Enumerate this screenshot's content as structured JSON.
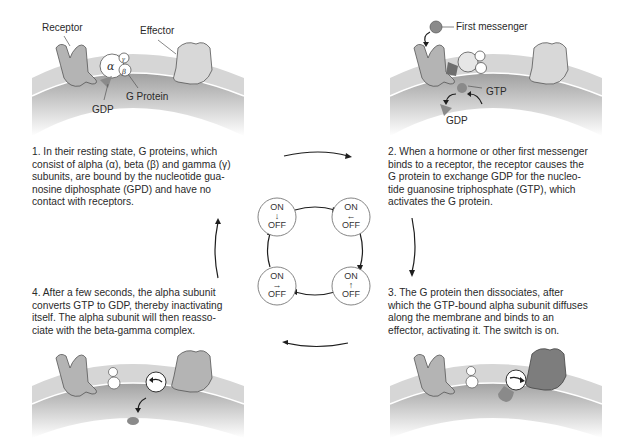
{
  "diagram": {
    "colors": {
      "membrane_outer": "#d6d6d6",
      "membrane_inner": "#8f8f8f",
      "protein_fill": "#b4b4b4",
      "protein_active": "#7d7d7d",
      "subunit_fill": "#ffffff",
      "gtp_fill": "#8a8a8a",
      "arrow": "#1e1e1e"
    },
    "panel1": {
      "labels": {
        "receptor": "Receptor",
        "effector": "Effector",
        "g_protein": "G Protein",
        "gdp": "GDP",
        "alpha": "α",
        "beta": "β",
        "gamma": "γ"
      },
      "caption": "1. In their resting state, G proteins, which\nconsist of alpha (α), beta (β) and gamma (γ)\nsubunits, are bound by the nucleotide gua-\nnosine diphosphate (GPD) and have no\ncontact with receptors."
    },
    "panel2": {
      "labels": {
        "first_messenger": "First messenger",
        "gtp": "GTP",
        "gdp": "GDP"
      },
      "caption": "2. When a hormone or other first messenger\nbinds to a receptor, the receptor causes the\nG protein to exchange GDP for the nucleo-\ntide guanosine triphosphate (GTP), which\nactivates the G protein."
    },
    "panel3": {
      "caption": "3. The G protein then dissociates, after\nwhich the GTP-bound alpha subunit diffuses\nalong the membrane and binds to an\neffector, activating it. The switch is on."
    },
    "panel4": {
      "caption": "4. After a few seconds, the alpha subunit\nconverts GTP to GDP, thereby inactivating\nitself. The alpha subunit will then reasso-\nciate with the beta-gamma complex."
    },
    "switch_cycle": {
      "states": [
        {
          "position": "top-left",
          "on": "ON",
          "arrow": "↓",
          "off": "OFF"
        },
        {
          "position": "top-right",
          "on": "ON",
          "arrow": "←",
          "off": "OFF"
        },
        {
          "position": "bottom-right",
          "on": "ON",
          "arrow": "↑",
          "off": "OFF"
        },
        {
          "position": "bottom-left",
          "on": "ON",
          "arrow": "→",
          "off": "OFF"
        }
      ]
    }
  }
}
